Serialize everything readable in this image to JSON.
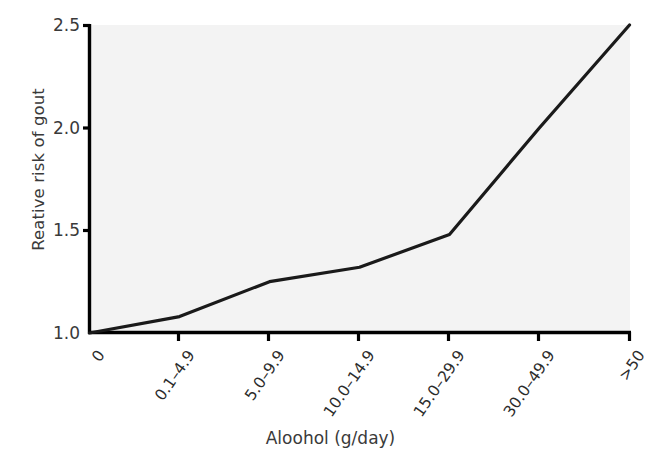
{
  "chart_data": {
    "type": "line",
    "title": "",
    "subtitle": "",
    "xlabel": "Aloohol (g/day)",
    "ylabel": "Reative risk of gout",
    "categories": [
      "0",
      "0.1–4.9",
      "5.0–9.9",
      "10.0–14.9",
      "15.0–29.9",
      "30.0–49.9",
      ">50"
    ],
    "values": [
      1.0,
      1.08,
      1.25,
      1.32,
      1.48,
      2.0,
      2.5
    ],
    "series": [
      {
        "name": "Relative risk of gout",
        "values": [
          1.0,
          1.08,
          1.25,
          1.32,
          1.48,
          2.0,
          2.5
        ]
      }
    ],
    "ylim": [
      1.0,
      2.5
    ],
    "yticks": [
      "1.0",
      "1.5",
      "2.0",
      "2.5"
    ],
    "ytick_values": [
      1.0,
      1.5,
      2.0,
      2.5
    ],
    "xtick_labels": [
      "0",
      "0.1–4.9",
      "5.0–9.9",
      "10.0–14.9",
      "15.0–29.9",
      "30.0–49.9",
      ">50"
    ],
    "grid": false,
    "legend": null,
    "legend_position": "none",
    "annotations": [],
    "line_color": "#1a1a1a",
    "line_width": 3,
    "plot_background": "#f3f3f3",
    "axis_color": "#000000",
    "figure_background": "#ffffff"
  }
}
